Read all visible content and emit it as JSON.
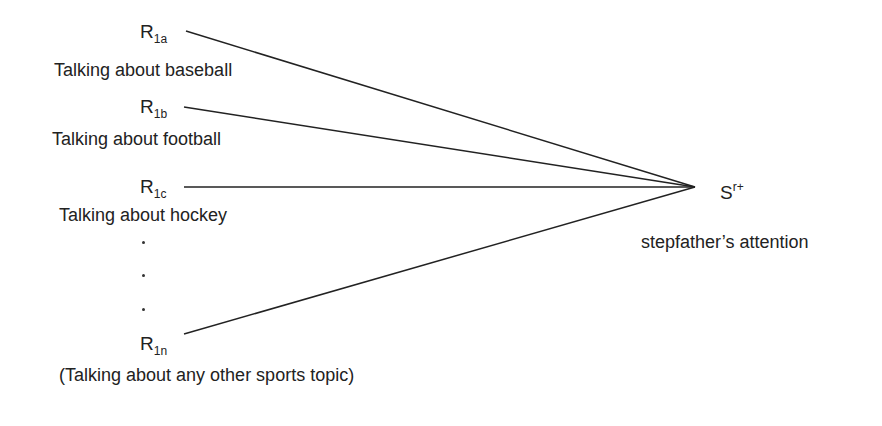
{
  "responses": [
    {
      "symbol": "R",
      "subscript": "1a",
      "label": "Talking about baseball"
    },
    {
      "symbol": "R",
      "subscript": "1b",
      "label": "Talking about football"
    },
    {
      "symbol": "R",
      "subscript": "1c",
      "label": "Talking about hockey"
    },
    {
      "symbol": "R",
      "subscript": "1n",
      "label": "(Talking about any other sports topic)"
    }
  ],
  "ellipsis": ".",
  "reinforcer": {
    "symbol": "S",
    "superscript": "r+",
    "label": "stepfather’s attention"
  },
  "line_color": "#222222"
}
